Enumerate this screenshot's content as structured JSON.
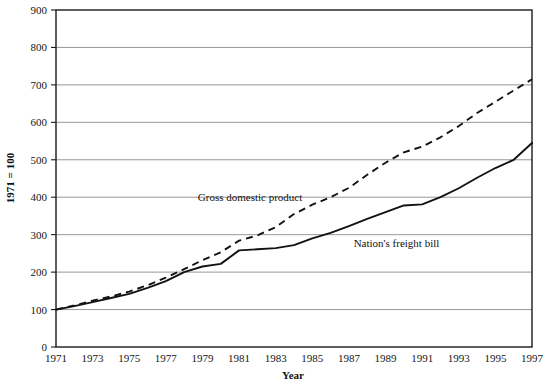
{
  "chart_data": {
    "type": "line",
    "title": "",
    "xlabel": "Year",
    "ylabel": "1971 = 100",
    "xlim": [
      1971,
      1997
    ],
    "ylim": [
      0,
      900
    ],
    "ytick_values": [
      0,
      100,
      200,
      300,
      400,
      500,
      600,
      700,
      800,
      900
    ],
    "ytick_labels": [
      "0",
      "100",
      "200",
      "300",
      "400",
      "500",
      "600",
      "700",
      "800",
      "900"
    ],
    "xtick_values": [
      1971,
      1973,
      1975,
      1977,
      1979,
      1981,
      1983,
      1985,
      1987,
      1989,
      1991,
      1993,
      1995,
      1997
    ],
    "xtick_labels": [
      "1971",
      "1973",
      "1975",
      "1977",
      "1979",
      "1981",
      "1983",
      "1985",
      "1987",
      "1989",
      "1991",
      "1993",
      "1995",
      "1997"
    ],
    "grid": "horizontal",
    "legend": "inline-annotations",
    "x": [
      1971,
      1972,
      1973,
      1974,
      1975,
      1976,
      1977,
      1978,
      1979,
      1980,
      1981,
      1982,
      1983,
      1984,
      1985,
      1986,
      1987,
      1988,
      1989,
      1990,
      1991,
      1992,
      1993,
      1994,
      1995,
      1996,
      1997
    ],
    "series": [
      {
        "name": "Gross domestic product",
        "style": "dashed",
        "color": "#121212",
        "values": [
          100,
          111,
          124,
          135,
          148,
          165,
          185,
          208,
          232,
          253,
          284,
          298,
          320,
          355,
          380,
          400,
          425,
          460,
          492,
          520,
          535,
          560,
          590,
          625,
          655,
          685,
          715
        ]
      },
      {
        "name": "Nation's freight bill",
        "style": "solid",
        "color": "#121212",
        "values": [
          100,
          109,
          120,
          131,
          142,
          158,
          176,
          200,
          215,
          222,
          258,
          261,
          264,
          272,
          290,
          305,
          323,
          342,
          360,
          378,
          381,
          400,
          424,
          452,
          478,
          500,
          545
        ]
      }
    ],
    "annotations": [
      {
        "text": "Gross domestic product",
        "x": 1981.6,
        "y": 390,
        "anchor": "middle"
      },
      {
        "text": "Nation's freight bill",
        "x": 1989.6,
        "y": 268,
        "anchor": "middle"
      }
    ]
  }
}
